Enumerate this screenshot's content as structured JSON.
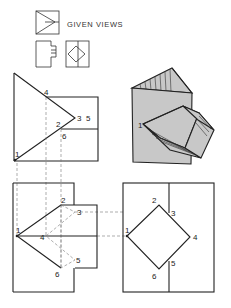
{
  "figure": {
    "legend_label": "GIVEN VIEWS",
    "views": {
      "top_view": {
        "labels": [
          "4",
          "3",
          "5",
          "2",
          "6",
          "1"
        ]
      },
      "pictorial": {
        "labels": [
          "1"
        ]
      },
      "front_view": {
        "labels": [
          "2",
          "3",
          "1",
          "4",
          "5",
          "6"
        ]
      },
      "side_view": {
        "labels": [
          "2",
          "3",
          "1",
          "4",
          "5",
          "6"
        ]
      }
    }
  }
}
